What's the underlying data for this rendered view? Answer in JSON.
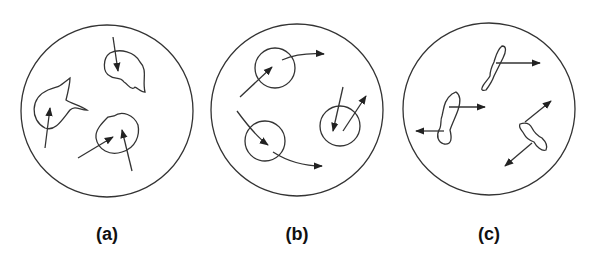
{
  "figure": {
    "panels": [
      {
        "label": "(a)",
        "description": "irregular particles with random arrows"
      },
      {
        "label": "(b)",
        "description": "circular particles with curved trajectories"
      },
      {
        "label": "(c)",
        "description": "elongated particles with bidirectional arrows"
      }
    ]
  }
}
